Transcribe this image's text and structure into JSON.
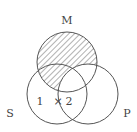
{
  "diagram": {
    "type": "venn",
    "circles": [
      {
        "id": "M",
        "label": "M",
        "cx": 67,
        "cy": 62,
        "r": 30
      },
      {
        "id": "S",
        "label": "S",
        "cx": 57,
        "cy": 94,
        "r": 30
      },
      {
        "id": "P",
        "label": "P",
        "cx": 88,
        "cy": 94,
        "r": 30
      }
    ],
    "shaded_region": "M minus P",
    "region_marks": {
      "one": "1",
      "cross": "×",
      "two": "2"
    },
    "colors": {
      "stroke": "#555555",
      "hatch": "#555555",
      "background": "#ffffff"
    }
  },
  "labels": {
    "M": "M",
    "S": "S",
    "P": "P"
  }
}
